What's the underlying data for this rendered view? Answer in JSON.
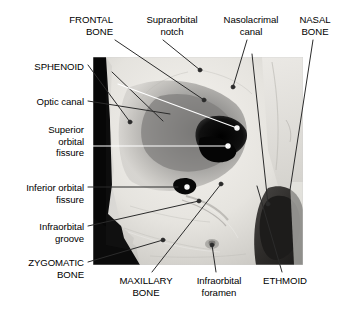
{
  "figure": {
    "type": "labeled-photograph",
    "image_subject": "right orbit of a human skull, anterolateral photographic view",
    "photo": {
      "left": 93,
      "top": 57,
      "right": 303,
      "bottom": 265,
      "background_tone": "#d9d9d9",
      "dark_band_color": "#0a0a0a",
      "bone_highlight_color": "#f2f0ec"
    },
    "leader_line_colors": {
      "dark": "#2b2b2b",
      "light": "#ffffff"
    }
  },
  "labels": [
    {
      "id": "frontal-bone",
      "text_lines": [
        "FRONTAL",
        "BONE"
      ],
      "style": "uppercase",
      "align": "right",
      "x": 113,
      "y": 14,
      "leader": {
        "color": "dark",
        "marker": "none",
        "points": [
          [
            115,
            40
          ],
          [
            190,
            104
          ]
        ]
      }
    },
    {
      "id": "supraorbital-notch",
      "text_lines": [
        "Supraorbital",
        "notch"
      ],
      "style": "sentence",
      "align": "center",
      "x": 172,
      "y": 14,
      "leader": {
        "color": "dark",
        "marker": "dot",
        "points": [
          [
            160,
            40
          ],
          [
            146,
            117
          ]
        ]
      }
    },
    {
      "id": "nasolacrimal-canal",
      "text_lines": [
        "Nasolacrimal",
        "canal"
      ],
      "style": "sentence",
      "align": "center",
      "x": 251,
      "y": 14,
      "leader": {
        "color": "dark",
        "marker": "none",
        "points": [
          [
            249,
            40
          ],
          [
            268,
            204
          ]
        ]
      }
    },
    {
      "id": "nasal-bone",
      "text_lines": [
        "NASAL",
        "BONE"
      ],
      "style": "uppercase",
      "align": "center",
      "x": 315,
      "y": 14,
      "leader": {
        "color": "dark",
        "marker": "none",
        "points": [
          [
            312,
            40
          ],
          [
            290,
            190
          ]
        ]
      }
    },
    {
      "id": "sphenoid",
      "text_lines": [
        "SPHENOID"
      ],
      "style": "uppercase",
      "align": "right",
      "x": 84,
      "y": 61,
      "leader": {
        "color": "dark",
        "marker": "dot",
        "points": [
          [
            88,
            66
          ],
          [
            113,
            75
          ]
        ]
      }
    },
    {
      "id": "optic-canal",
      "text_lines": [
        "Optic canal"
      ],
      "style": "sentence",
      "align": "right",
      "x": 84,
      "y": 96,
      "leader": {
        "color": "dark",
        "marker": "dot",
        "points": [
          [
            88,
            101
          ],
          [
            170,
            114
          ]
        ]
      }
    },
    {
      "id": "superior-orbital-fissure",
      "text_lines": [
        "Superior",
        "orbital",
        "fissure"
      ],
      "style": "sentence",
      "align": "right",
      "x": 84,
      "y": 124,
      "leader": {
        "color": "light",
        "marker": "dot",
        "points": [
          [
            88,
            146
          ],
          [
            228,
            146
          ]
        ]
      }
    },
    {
      "id": "inferior-orbital-fissure",
      "text_lines": [
        "Inferior orbital",
        "fissure"
      ],
      "style": "sentence",
      "align": "right",
      "x": 84,
      "y": 182,
      "leader": {
        "color": "dark",
        "marker": "dot",
        "points": [
          [
            88,
            187
          ],
          [
            187,
            187
          ]
        ]
      }
    },
    {
      "id": "infraorbital-groove",
      "text_lines": [
        "Infraorbital",
        "groove"
      ],
      "style": "sentence",
      "align": "right",
      "x": 84,
      "y": 221,
      "leader": {
        "color": "dark",
        "marker": "dot",
        "points": [
          [
            88,
            226
          ],
          [
            199,
            201
          ]
        ]
      }
    },
    {
      "id": "zygomatic-bone",
      "text_lines": [
        "ZYGOMATIC",
        "BONE"
      ],
      "style": "uppercase",
      "align": "right",
      "x": 84,
      "y": 257,
      "leader": {
        "color": "dark",
        "marker": "dot",
        "points": [
          [
            88,
            262
          ],
          [
            163,
            240
          ]
        ]
      }
    },
    {
      "id": "maxillary-bone",
      "text_lines": [
        "MAXILLARY",
        "BONE"
      ],
      "style": "uppercase",
      "align": "center",
      "x": 146,
      "y": 275,
      "leader": {
        "color": "dark",
        "marker": "dot",
        "points": [
          [
            152,
            274
          ],
          [
            221,
            184
          ]
        ]
      }
    },
    {
      "id": "infraorbital-foramen",
      "text_lines": [
        "Infraorbital",
        "foramen"
      ],
      "style": "sentence",
      "align": "center",
      "x": 219,
      "y": 275,
      "leader": {
        "color": "dark",
        "marker": "dot",
        "points": [
          [
            217,
            274
          ],
          [
            212,
            245
          ]
        ]
      }
    },
    {
      "id": "ethmoid",
      "text_lines": [
        "ETHMOID"
      ],
      "style": "uppercase",
      "align": "center",
      "x": 285,
      "y": 275,
      "leader": {
        "color": "dark",
        "marker": "none",
        "points": [
          [
            281,
            274
          ],
          [
            257,
            186
          ]
        ]
      }
    }
  ],
  "photo_markers": [
    {
      "id": "marker-supraorbital-notch",
      "x": 200,
      "y": 70,
      "color": "dark"
    },
    {
      "id": "marker-nasolacrimal-canal",
      "x": 233,
      "y": 87,
      "color": "dark"
    },
    {
      "id": "marker-frontal-bone",
      "x": 204,
      "y": 100,
      "color": "dark"
    },
    {
      "id": "marker-sphenoid",
      "x": 130,
      "y": 122,
      "color": "dark"
    },
    {
      "id": "marker-optic-canal",
      "x": 237,
      "y": 128,
      "color": "light"
    },
    {
      "id": "marker-superior-orbital-fissure",
      "x": 228,
      "y": 146,
      "color": "light"
    },
    {
      "id": "marker-inferior-orbital-fissure",
      "x": 187,
      "y": 187,
      "color": "light"
    },
    {
      "id": "marker-maxillary-bone",
      "x": 221,
      "y": 184,
      "color": "dark"
    },
    {
      "id": "marker-infraorbital-groove",
      "x": 199,
      "y": 201,
      "color": "dark"
    },
    {
      "id": "marker-nasolacrimal-end",
      "x": 268,
      "y": 204,
      "color": "dark"
    },
    {
      "id": "marker-zygomatic-bone",
      "x": 163,
      "y": 240,
      "color": "dark"
    },
    {
      "id": "marker-infraorbital-foramen",
      "x": 212,
      "y": 245,
      "color": "dark"
    }
  ]
}
